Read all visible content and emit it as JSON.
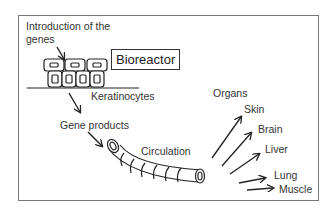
{
  "diagram": {
    "labels": {
      "intro_line1": "Introduction of the",
      "intro_line2": "genes",
      "bioreactor": "Bioreactor",
      "keratinocytes": "Keratinocytes",
      "gene_products": "Gene products",
      "circulation": "Circulation",
      "organs": "Organs"
    },
    "organs": [
      "Skin",
      "Brain",
      "Liver",
      "Lung",
      "Muscle"
    ],
    "colors": {
      "line": "#222222",
      "frame": "#777777",
      "background": "#ffffff"
    }
  }
}
